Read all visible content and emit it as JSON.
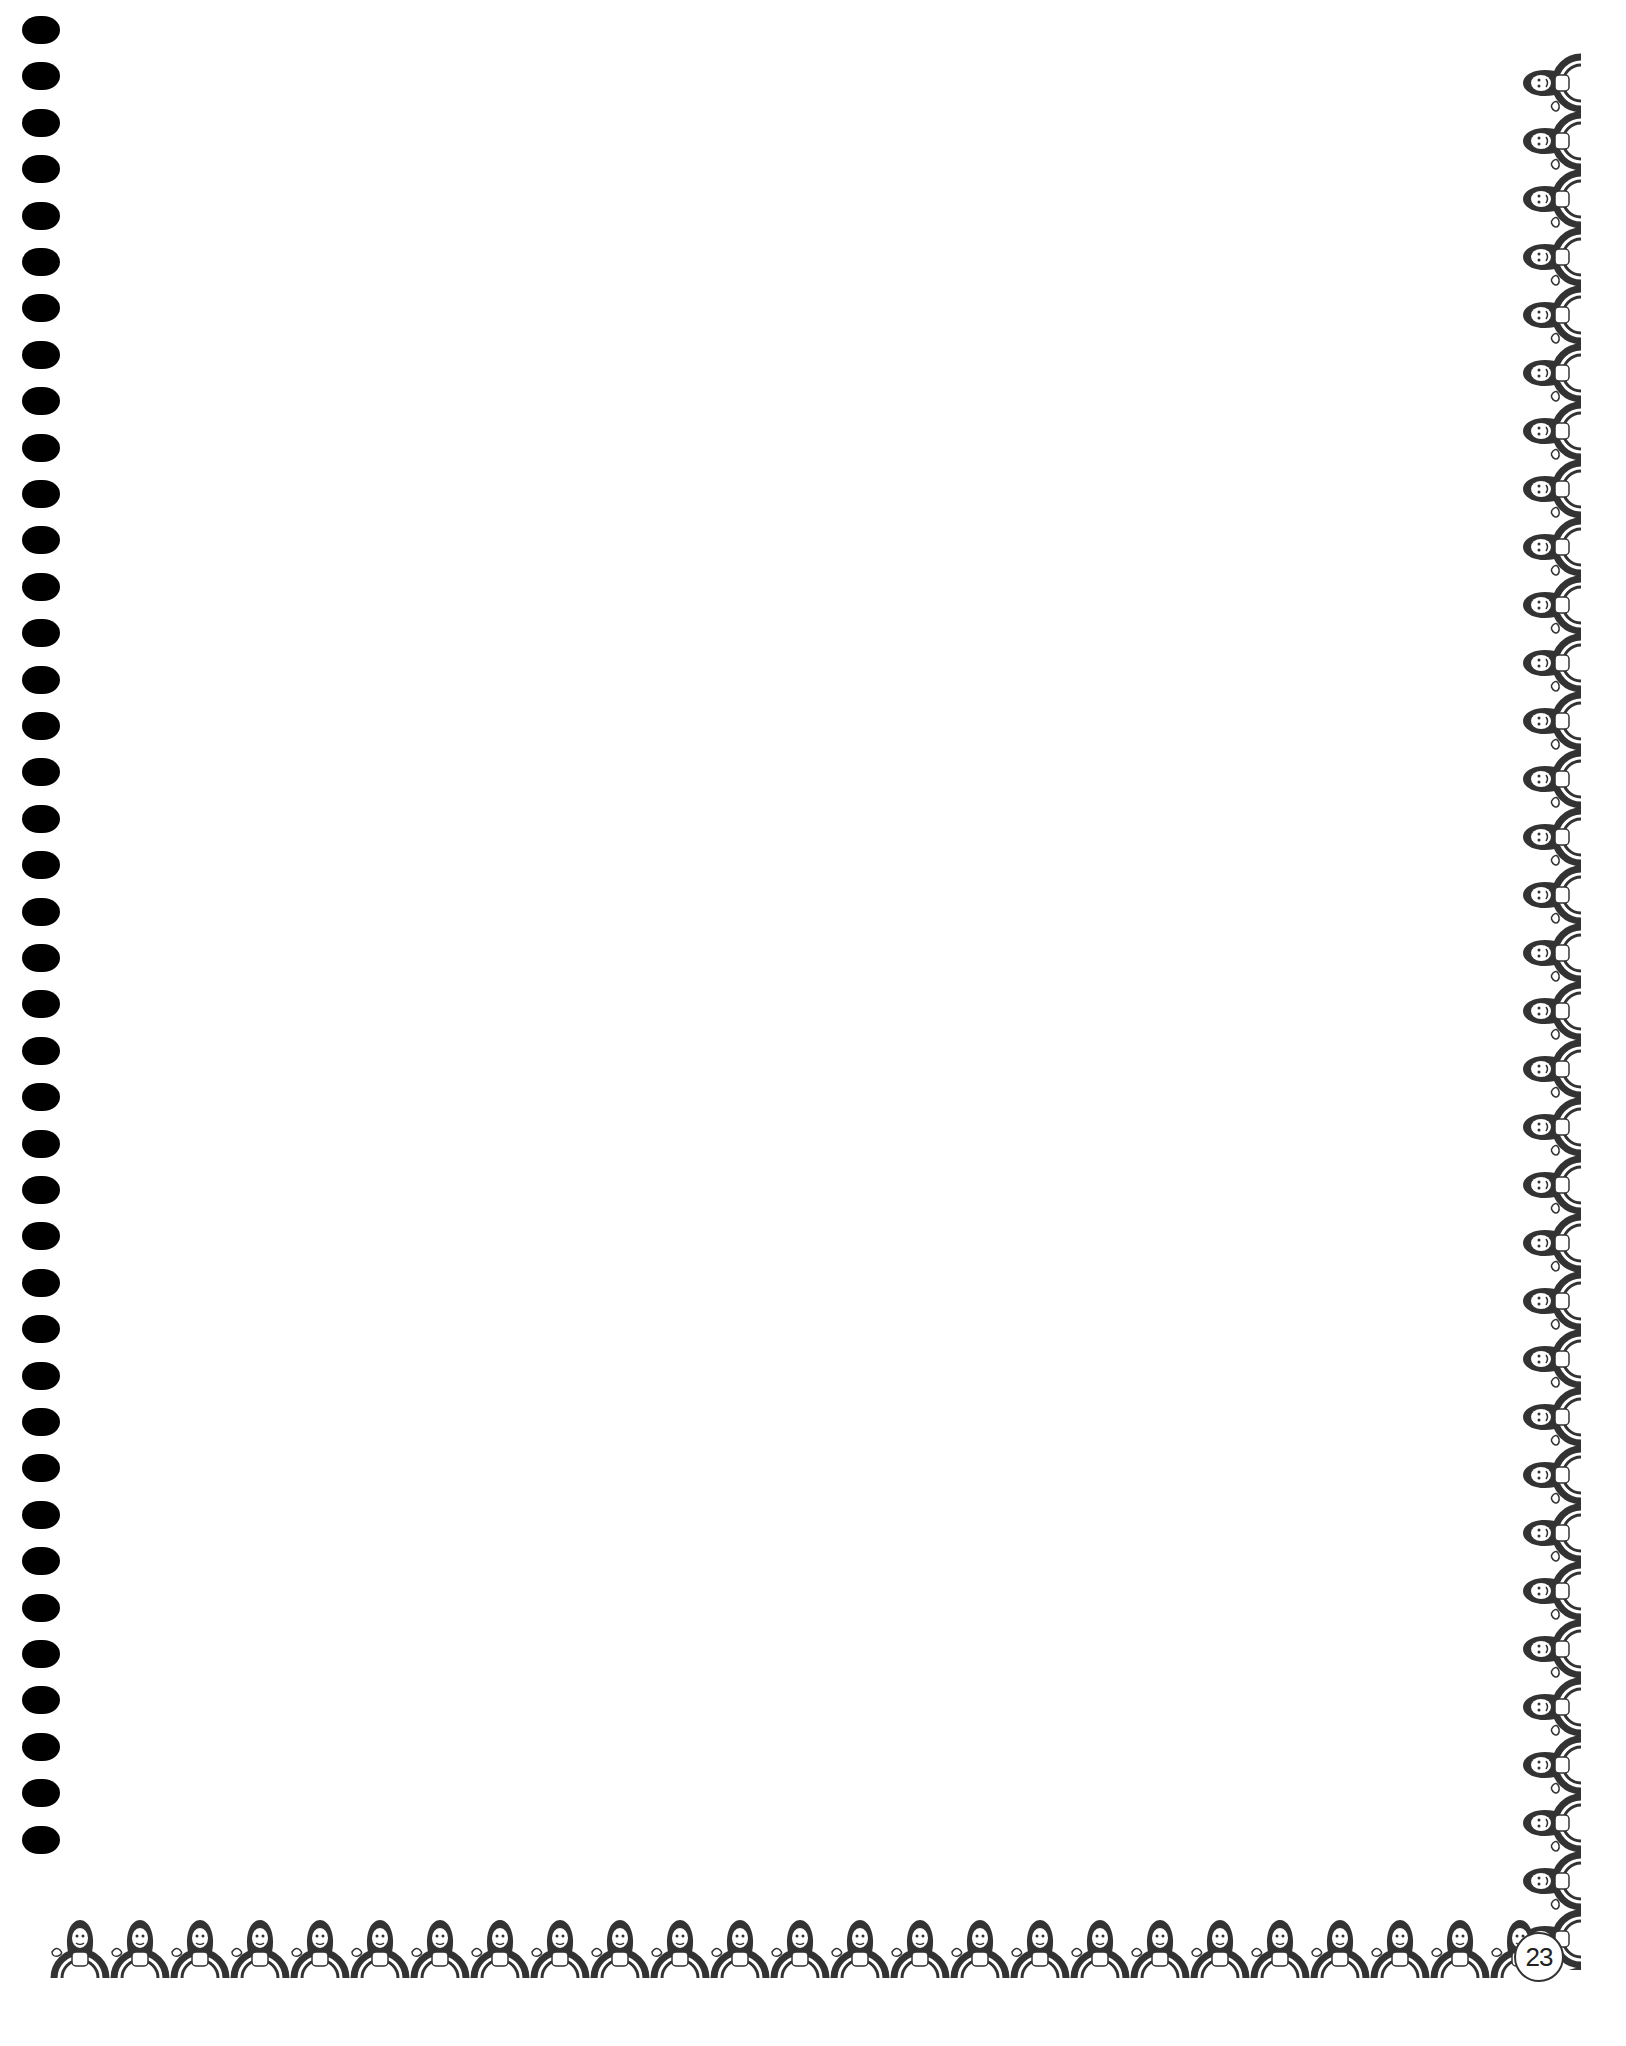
{
  "document": {
    "type": "spiral-bound notebook page",
    "page_number": "23",
    "content_area": "blank",
    "binding": {
      "hole_count": 40,
      "hole_color": "#000000"
    },
    "border": {
      "style": "ornamental figure-and-bird pattern",
      "sides": [
        "right",
        "bottom"
      ],
      "color": "#333333"
    }
  }
}
